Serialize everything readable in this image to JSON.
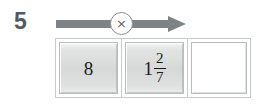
{
  "problem": {
    "number": "5",
    "operation": {
      "symbol": "×",
      "name": "multiply",
      "arrow_direction": "right",
      "arrow_color": "#7f8386"
    },
    "boxes": [
      {
        "name": "operand-1",
        "kind": "given",
        "value": "8",
        "filled": true
      },
      {
        "name": "operand-2",
        "kind": "given",
        "mixed_number": {
          "whole": "1",
          "numerator": "2",
          "denominator": "7"
        },
        "filled": true
      },
      {
        "name": "answer",
        "kind": "blank",
        "value": "",
        "placeholder": "",
        "filled": false
      }
    ]
  },
  "colors": {
    "page_background": "#ffffff",
    "number_text": "#555a5e",
    "arrow": "#7f8386",
    "box_border": "#b9bdbf",
    "box_fill_light": "#f3f4f4",
    "box_fill_dark": "#d7d9d9",
    "value_text": "#1b1b1b",
    "blank_box_fill": "#ffffff"
  }
}
